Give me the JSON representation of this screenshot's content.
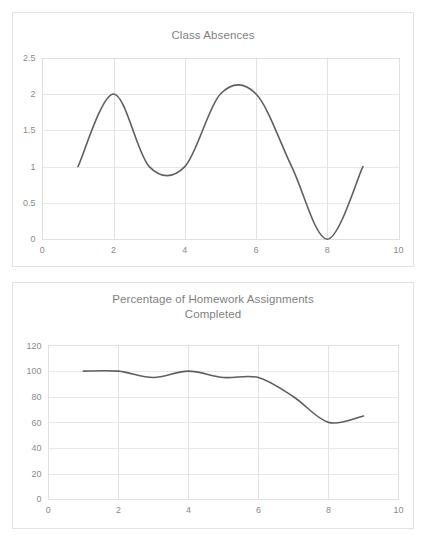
{
  "page": {
    "background_color": "#ffffff",
    "width": 429,
    "height": 544
  },
  "style": {
    "line_color": "#5f5f5f",
    "grid_color": "#e8e8e8",
    "title_color": "#7f7f7f",
    "tick_color": "#8a8a8a",
    "panel_border_color": "#e3e3e3"
  },
  "charts": [
    {
      "id": "class-absences",
      "title": "Class Absences"
    },
    {
      "id": "homework-completed",
      "title_line1": "Percentage of Homework Assignments",
      "title_line2": "Completed"
    }
  ],
  "chart_data": [
    {
      "type": "line",
      "title": "Class Absences",
      "xlabel": "",
      "ylabel": "",
      "x": [
        1,
        2,
        3,
        4,
        5,
        6,
        7,
        8,
        9
      ],
      "values": [
        1,
        2,
        1,
        1,
        2,
        2,
        1,
        0,
        1
      ],
      "series": [
        {
          "name": "Class Absences",
          "values": [
            1,
            2,
            1,
            1,
            2,
            2,
            1,
            0,
            1
          ]
        }
      ],
      "smooth": true,
      "xlim": [
        0,
        10
      ],
      "ylim": [
        0,
        2.5
      ],
      "xticks": [
        0,
        2,
        4,
        6,
        8,
        10
      ],
      "xtick_labels": [
        "0",
        "2",
        "4",
        "6",
        "8",
        "10"
      ],
      "yticks": [
        0,
        0.5,
        1,
        1.5,
        2,
        2.5
      ],
      "ytick_labels": [
        "0",
        "0.5",
        "1",
        "1.5",
        "2",
        "2.5"
      ],
      "grid": true,
      "legend": false,
      "legend_position": "none"
    },
    {
      "type": "line",
      "title": "Percentage of Homework Assignments Completed",
      "xlabel": "",
      "ylabel": "",
      "x": [
        1,
        2,
        3,
        4,
        5,
        6,
        7,
        8,
        9
      ],
      "values": [
        100,
        100,
        95,
        100,
        95,
        95,
        80,
        60,
        65
      ],
      "series": [
        {
          "name": "Percentage of Homework Assignments Completed",
          "values": [
            100,
            100,
            95,
            100,
            95,
            95,
            80,
            60,
            65
          ]
        }
      ],
      "smooth": true,
      "xlim": [
        0,
        10
      ],
      "ylim": [
        0,
        120
      ],
      "xticks": [
        0,
        2,
        4,
        6,
        8,
        10
      ],
      "xtick_labels": [
        "0",
        "2",
        "4",
        "6",
        "8",
        "10"
      ],
      "yticks": [
        0,
        20,
        40,
        60,
        80,
        100,
        120
      ],
      "ytick_labels": [
        "0",
        "20",
        "40",
        "60",
        "80",
        "100",
        "120"
      ],
      "grid": true,
      "legend": false,
      "legend_position": "none"
    }
  ]
}
